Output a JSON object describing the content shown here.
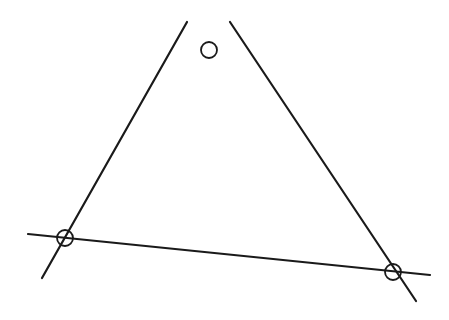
{
  "diagram": {
    "type": "triangle-with-circled-vertices",
    "stroke_color": "#1a1a1a",
    "background": "#ffffff",
    "lines": [
      {
        "name": "left-side",
        "x1": 187,
        "y1": 22,
        "x2": 42,
        "y2": 278
      },
      {
        "name": "right-side",
        "x1": 230,
        "y1": 22,
        "x2": 416,
        "y2": 301
      },
      {
        "name": "bottom-side",
        "x1": 28,
        "y1": 234,
        "x2": 430,
        "y2": 275
      }
    ],
    "vertices": [
      {
        "name": "top",
        "cx": 209,
        "cy": 50,
        "r": 8
      },
      {
        "name": "bottom-left",
        "cx": 65,
        "cy": 238,
        "r": 8
      },
      {
        "name": "bottom-right",
        "cx": 393,
        "cy": 272,
        "r": 8
      }
    ]
  }
}
